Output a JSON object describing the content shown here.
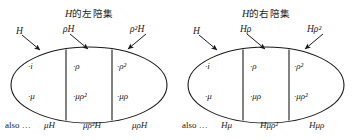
{
  "figure": {
    "background": "#ffffff",
    "ink": "#1a1a1a",
    "panels": [
      {
        "id": "left-cosets",
        "title_math": "H",
        "title_cjk": "的左陪集",
        "arrow_labels": [
          {
            "name": "coset-label-H",
            "text": "H"
          },
          {
            "name": "coset-label-rhoH",
            "text": "ρH"
          },
          {
            "name": "coset-label-rho2H",
            "text": "ρ²H"
          }
        ],
        "cells": {
          "top": [
            "·i",
            "·ρ",
            "·ρ²"
          ],
          "bottom": [
            "·μ",
            "·μρ²",
            "·μρ"
          ]
        },
        "footer": {
          "also_label": "also …",
          "items": [
            "μH",
            "μρ²H",
            "μρH"
          ]
        }
      },
      {
        "id": "right-cosets",
        "title_math": "H",
        "title_cjk": "的右陪集",
        "arrow_labels": [
          {
            "name": "coset-label-H",
            "text": "H"
          },
          {
            "name": "coset-label-Hrho",
            "text": "Hρ"
          },
          {
            "name": "coset-label-Hrho2",
            "text": "Hρ²"
          }
        ],
        "cells": {
          "top": [
            "·i",
            "·ρ",
            "·ρ²"
          ],
          "bottom": [
            "·μ",
            "·μρ",
            "·μρ²"
          ]
        },
        "footer": {
          "also_label": "also …",
          "items": [
            "Hμ",
            "Hμρ²",
            "Hμρ"
          ]
        }
      }
    ]
  }
}
